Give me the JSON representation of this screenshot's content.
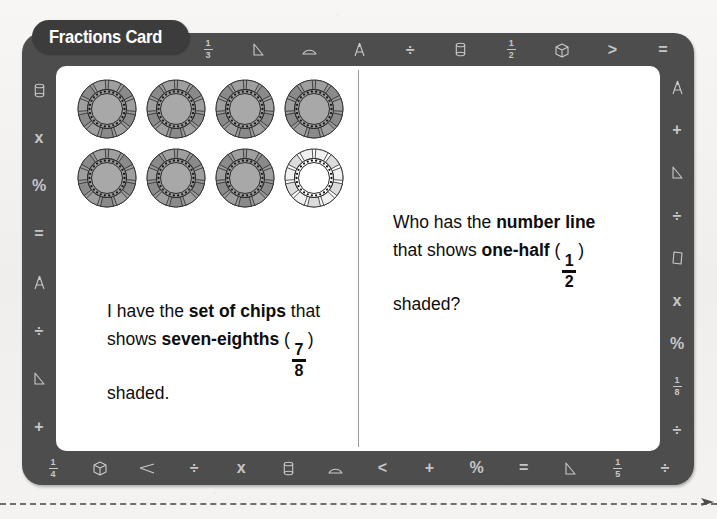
{
  "card": {
    "title": "Fractions Card",
    "frame_color": "#4d4d4d",
    "inner_color": "#ffffff"
  },
  "panels": {
    "left": {
      "statement": {
        "lead": "I have the ",
        "bold1": "set of chips",
        "mid": "that shows ",
        "bold2": "seven-eighths",
        "open_paren": "(",
        "fraction_numerator": "7",
        "fraction_denominator": "8",
        "close_paren": ")",
        "tail": " shaded."
      },
      "visual": {
        "type": "set-of-chips",
        "columns": 4,
        "rows": 2,
        "total": 8,
        "shaded": 7,
        "unshaded": 1,
        "shaded_fill": "#a8a8a8",
        "unshaded_fill": "#ffffff"
      }
    },
    "right": {
      "question": {
        "lead": "Who has the ",
        "bold1": "number line",
        "mid": " that shows ",
        "bold2": "one-half",
        "open_paren": "(",
        "fraction_numerator": "1",
        "fraction_denominator": "2",
        "close_paren": ")",
        "tail": " shaded?"
      }
    }
  },
  "borders": {
    "top": [
      {
        "icon": "fraction-one-third",
        "num": "1",
        "den": "3"
      },
      {
        "icon": "triangle-icon"
      },
      {
        "icon": "protractor-icon"
      },
      {
        "icon": "compass-icon"
      },
      {
        "icon": "divide-icon",
        "glyph": "÷"
      },
      {
        "icon": "cylinder-icon"
      },
      {
        "icon": "fraction-one-half",
        "num": "1",
        "den": "2"
      },
      {
        "icon": "cube-icon"
      },
      {
        "icon": "greater-than-icon",
        "glyph": ">"
      },
      {
        "icon": "equals-icon",
        "glyph": "="
      }
    ],
    "bottom": [
      {
        "icon": "fraction-one-fourth",
        "num": "1",
        "den": "4"
      },
      {
        "icon": "cube-icon"
      },
      {
        "icon": "arrow-left-icon"
      },
      {
        "icon": "divide-icon",
        "glyph": "÷"
      },
      {
        "icon": "multiply-icon",
        "glyph": "x"
      },
      {
        "icon": "cylinder-icon"
      },
      {
        "icon": "protractor-icon"
      },
      {
        "icon": "less-than-icon",
        "glyph": "<"
      },
      {
        "icon": "plus-icon",
        "glyph": "+"
      },
      {
        "icon": "percent-icon",
        "glyph": "%"
      },
      {
        "icon": "equals-icon",
        "glyph": "="
      },
      {
        "icon": "triangle-icon"
      },
      {
        "icon": "fraction-one-fifth",
        "num": "1",
        "den": "5"
      },
      {
        "icon": "divide-icon",
        "glyph": "÷"
      }
    ],
    "left": [
      {
        "icon": "cylinder-icon"
      },
      {
        "icon": "multiply-icon",
        "glyph": "x"
      },
      {
        "icon": "percent-icon",
        "glyph": "%"
      },
      {
        "icon": "equals-icon",
        "glyph": "="
      },
      {
        "icon": "compass-icon"
      },
      {
        "icon": "divide-icon",
        "glyph": "÷"
      },
      {
        "icon": "triangle-icon"
      },
      {
        "icon": "plus-icon",
        "glyph": "+"
      }
    ],
    "right": [
      {
        "icon": "compass-icon"
      },
      {
        "icon": "plus-icon",
        "glyph": "+"
      },
      {
        "icon": "triangle-icon"
      },
      {
        "icon": "divide-icon",
        "glyph": "÷"
      },
      {
        "icon": "rectangle-icon"
      },
      {
        "icon": "multiply-icon",
        "glyph": "x"
      },
      {
        "icon": "percent-icon",
        "glyph": "%"
      },
      {
        "icon": "fraction-one-eighth",
        "num": "1",
        "den": "8"
      },
      {
        "icon": "divide-icon",
        "glyph": "÷"
      }
    ]
  }
}
